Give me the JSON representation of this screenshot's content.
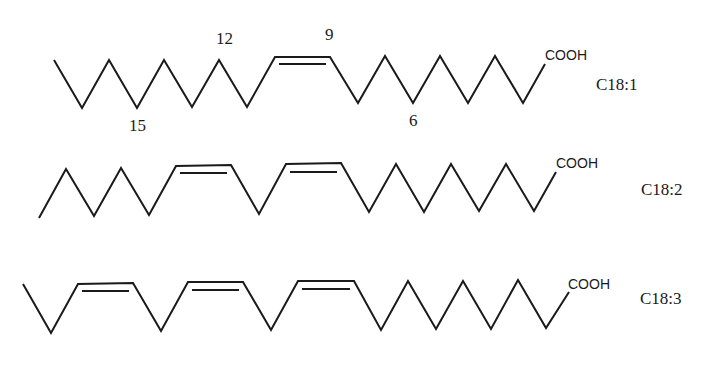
{
  "diagram": {
    "type": "skeletal-formulas",
    "molecules": [
      {
        "name": "C18:1",
        "label": "C18:1",
        "terminal_group": "COOH",
        "double_bonds": 1,
        "position_labels": [
          {
            "text": "12",
            "position": "above"
          },
          {
            "text": "9",
            "position": "above"
          },
          {
            "text": "15",
            "position": "below"
          },
          {
            "text": "6",
            "position": "below"
          }
        ]
      },
      {
        "name": "C18:2",
        "label": "C18:2",
        "terminal_group": "COOH",
        "double_bonds": 2
      },
      {
        "name": "C18:3",
        "label": "C18:3",
        "terminal_group": "COOH",
        "double_bonds": 3
      }
    ]
  },
  "labels": {
    "m1_pos_12": "12",
    "m1_pos_9": "9",
    "m1_pos_15": "15",
    "m1_pos_6": "6",
    "m1_cooh": "COOH",
    "m1_name": "C18:1",
    "m2_cooh": "COOH",
    "m2_name": "C18:2",
    "m3_cooh": "COOH",
    "m3_name": "C18:3"
  },
  "colors": {
    "line": "#1a1a1a",
    "background": "#ffffff"
  }
}
